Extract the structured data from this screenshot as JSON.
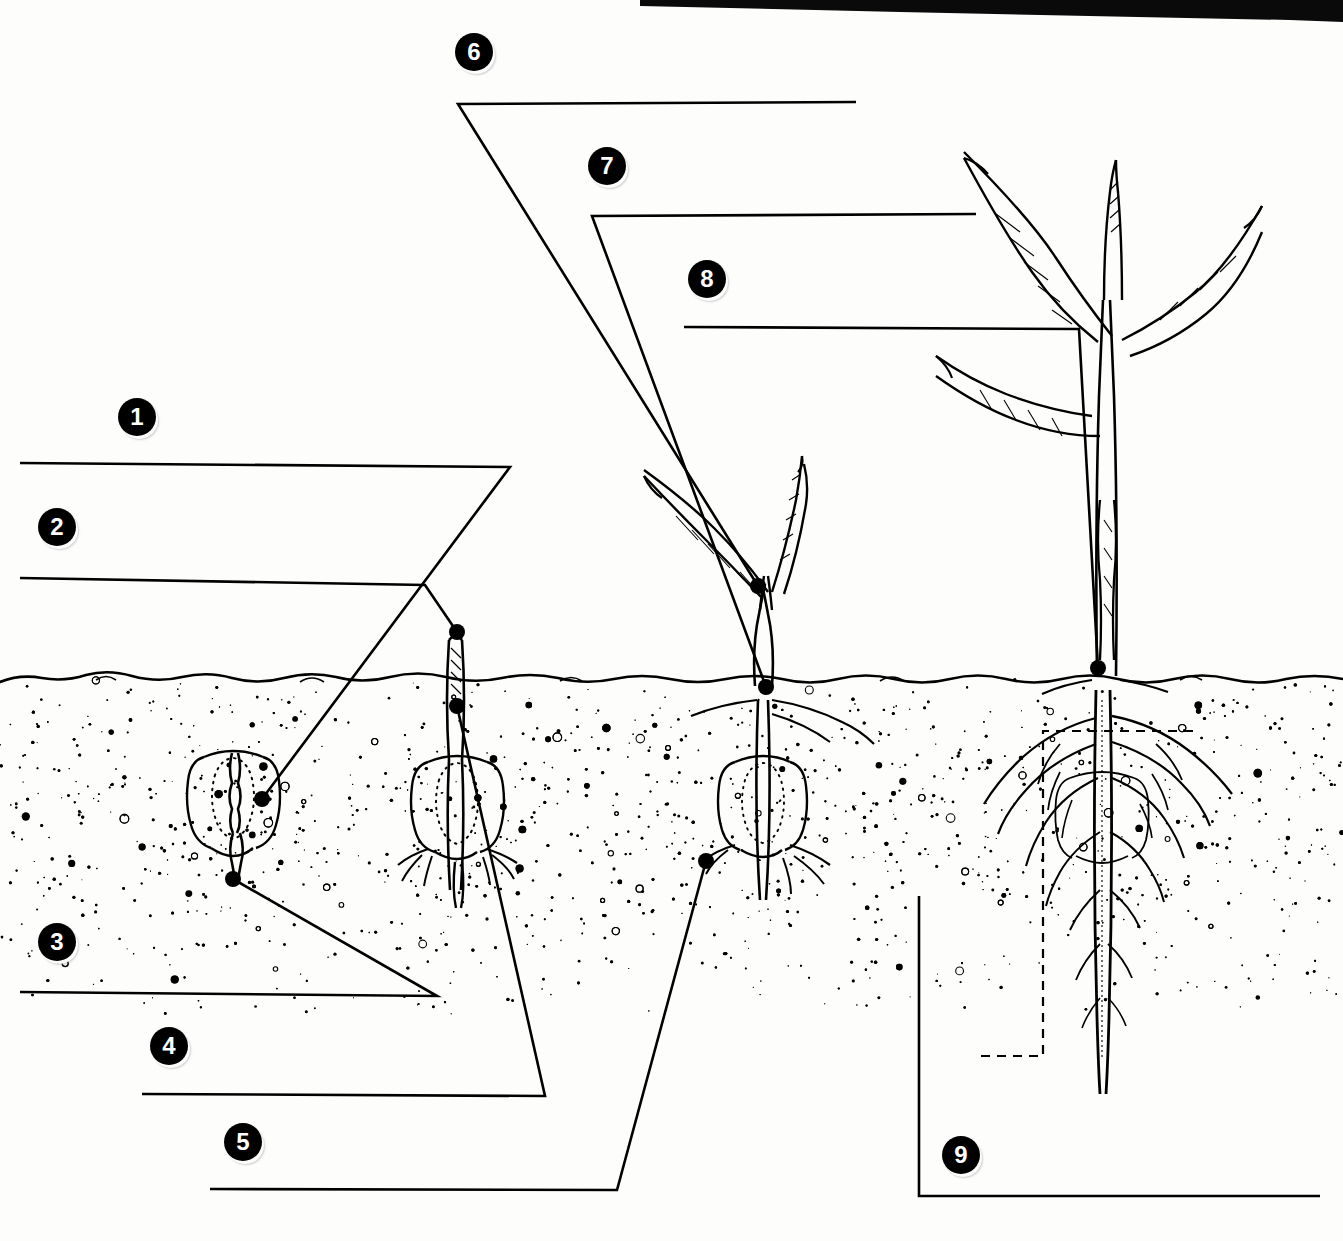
{
  "document": {
    "title": "Corn Seed Germination and Seedling Development",
    "subject": "maize-germination-stages",
    "type": "labeled-diagram-worksheet",
    "background_color": "#fdfdfc",
    "ink_color": "#000000"
  },
  "scan_artifact": {
    "name": "top-edge-scan-shadow",
    "color": "#0a0a0a",
    "description": "dark scanned page edge band across upper right"
  },
  "callouts": [
    {
      "id": "1",
      "label": "1",
      "badge_x": 118,
      "badge_y": 398,
      "line": "M 20 463 L 510 467 L 262 799",
      "anchor_x": 262,
      "anchor_y": 799,
      "has_dot": true
    },
    {
      "id": "2",
      "label": "2",
      "badge_x": 38,
      "badge_y": 508,
      "line": "M 20 578 L 425 585 L 457 632",
      "anchor_x": 457,
      "anchor_y": 632,
      "has_dot": true
    },
    {
      "id": "3",
      "label": "3",
      "badge_x": 38,
      "badge_y": 923,
      "line": "M 20 992 L 437 996 L 233 879",
      "anchor_x": 233,
      "anchor_y": 879,
      "has_dot": true
    },
    {
      "id": "4",
      "label": "4",
      "badge_x": 150,
      "badge_y": 1027,
      "line": "M 142 1094 L 545 1096 L 457 706",
      "anchor_x": 457,
      "anchor_y": 706,
      "has_dot": true
    },
    {
      "id": "5",
      "label": "5",
      "badge_x": 224,
      "badge_y": 1123,
      "line": "M 210 1189 L 617 1190 L 706 861",
      "anchor_x": 706,
      "anchor_y": 861,
      "has_dot": true
    },
    {
      "id": "6",
      "label": "6",
      "badge_x": 455,
      "badge_y": 33,
      "line": "M 856 102 L 458 104 L 758 586",
      "anchor_x": 758,
      "anchor_y": 586,
      "has_dot": true
    },
    {
      "id": "7",
      "label": "7",
      "badge_x": 588,
      "badge_y": 147,
      "line": "M 976 214 L 592 216 L 766 687",
      "anchor_x": 766,
      "anchor_y": 687,
      "has_dot": true
    },
    {
      "id": "8",
      "label": "8",
      "badge_x": 688,
      "badge_y": 260,
      "line": "M 684 327 L 1079 329 L 1098 668",
      "anchor_x": 1098,
      "anchor_y": 668,
      "has_dot": true
    },
    {
      "id": "9",
      "label": "9",
      "badge_x": 942,
      "badge_y": 1136,
      "line": "M 1320 1196 L 919 1196 L 919 896",
      "anchor_x": 919,
      "anchor_y": 896,
      "has_dot": false,
      "dashed_box": "M 981 1056 L 1043 1056 L 1043 731 L 1200 731"
    }
  ],
  "soil": {
    "name": "soil-cross-section",
    "surface_y": 672,
    "stipple_fade_y": 1010,
    "description": "irregular soil surface line with stippled granular texture fading with depth"
  },
  "stages": [
    {
      "id": "stage-1",
      "name": "imbibed-seed",
      "center_x": 233,
      "description": "maize kernel in soil, embryo visible, radicle beginning to emerge downward",
      "parts_pointed_to": [
        "1",
        "3"
      ]
    },
    {
      "id": "stage-2",
      "name": "coleoptile-emergence",
      "center_x": 457,
      "description": "kernel with seminal roots and coleoptile pushing above the soil surface",
      "parts_pointed_to": [
        "2",
        "4"
      ]
    },
    {
      "id": "stage-3",
      "name": "first-leaves",
      "center_x": 762,
      "description": "seedling with two expanding leaves, crown at soil line, seminal root system",
      "parts_pointed_to": [
        "5",
        "6",
        "7"
      ]
    },
    {
      "id": "stage-4",
      "name": "established-seedling",
      "center_x": 1110,
      "description": "young corn plant with five wavy leaves and fibrous nodal root system",
      "parts_pointed_to": [
        "8",
        "9"
      ]
    }
  ]
}
